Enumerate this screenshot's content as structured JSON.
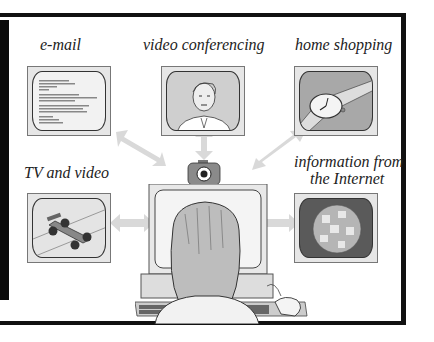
{
  "diagram": {
    "title": "",
    "nodes": [
      {
        "id": "email",
        "label": "e-mail"
      },
      {
        "id": "video-conferencing",
        "label": "video conferencing"
      },
      {
        "id": "home-shopping",
        "label": "home shopping"
      },
      {
        "id": "tv-video",
        "label": "TV and video"
      },
      {
        "id": "internet",
        "label_line1": "information from",
        "label_line2": "the Internet"
      },
      {
        "id": "central-computer",
        "label": ""
      }
    ],
    "edges": [
      {
        "from": "central-computer",
        "to": "email",
        "type": "bidirectional"
      },
      {
        "from": "central-computer",
        "to": "video-conferencing",
        "type": "bidirectional"
      },
      {
        "from": "central-computer",
        "to": "home-shopping",
        "type": "bidirectional"
      },
      {
        "from": "central-computer",
        "to": "tv-video",
        "type": "bidirectional"
      },
      {
        "from": "central-computer",
        "to": "internet",
        "type": "bidirectional"
      }
    ],
    "colors": {
      "frame": "#111111",
      "arrow": "#d9d9d9",
      "screen_bg": "#e6e6e6",
      "internet_screen": "#5a5a5a"
    }
  }
}
